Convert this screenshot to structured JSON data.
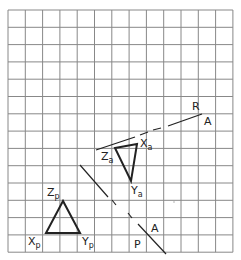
{
  "grid": {
    "x0": 8,
    "y0": 10,
    "cols": 13,
    "rows": 14,
    "cell_w": 17.3,
    "cell_h": 17.3,
    "line_color": "#888888"
  },
  "triangle_a": {
    "vertices": {
      "Z": [
        115,
        148
      ],
      "X": [
        137,
        144
      ],
      "Y": [
        131,
        181
      ]
    },
    "labels": {
      "Z": {
        "main": "Z",
        "sub": "a"
      },
      "X": {
        "main": "X",
        "sub": "a"
      },
      "Y": {
        "main": "Y",
        "sub": "a"
      }
    }
  },
  "triangle_p": {
    "vertices": {
      "Z": [
        63,
        201
      ],
      "X": [
        46,
        233
      ],
      "Y": [
        80,
        233
      ]
    },
    "labels": {
      "Z": {
        "main": "Z",
        "sub": "p"
      },
      "X": {
        "main": "X",
        "sub": "p"
      },
      "Y": {
        "main": "Y",
        "sub": "p"
      }
    }
  },
  "line_ra": {
    "label_r": "R",
    "label_a": "A",
    "segments": [
      [
        96,
        150,
        135,
        137
      ],
      [
        140,
        135,
        148,
        132
      ],
      [
        153,
        130,
        161,
        128
      ],
      [
        168,
        126,
        202,
        114
      ]
    ]
  },
  "line_ap": {
    "label_a": "A",
    "label_p": "P",
    "segments": [
      [
        80,
        165,
        108,
        197
      ],
      [
        112,
        200,
        116,
        205
      ],
      [
        128,
        213,
        132,
        218
      ],
      [
        138,
        224,
        166,
        254
      ]
    ]
  },
  "stroke_color": "#222222"
}
